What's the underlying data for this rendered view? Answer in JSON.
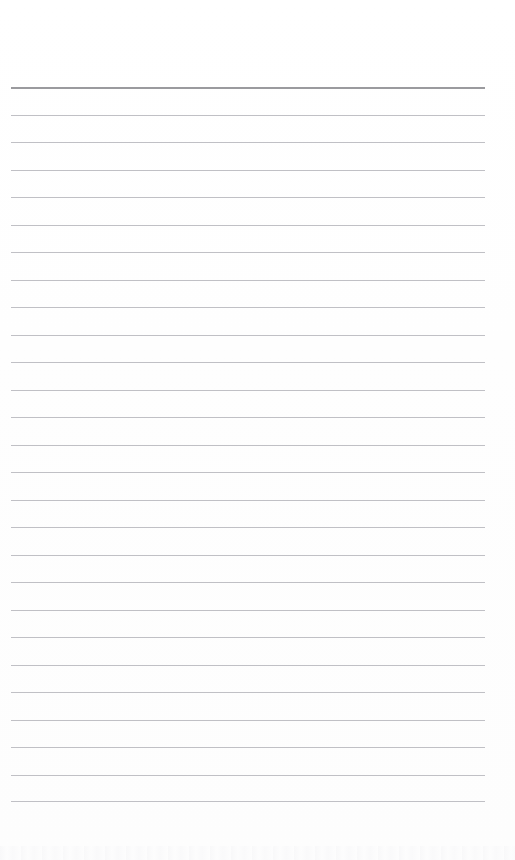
{
  "page": {
    "kind": "scanned-ruled-paper",
    "width": 515,
    "height": 860,
    "background_color": "#fefefe",
    "text_content": ""
  },
  "ruling": {
    "line_color": "#bdbdc2",
    "header_line_color": "#9a9a9e",
    "line_count": 27,
    "line_spacing": 27.5,
    "first_line_y": 87,
    "last_line_y": 801,
    "line_left_x": 11,
    "line_right_x": 485,
    "line_thickness": 1,
    "header_line_thickness": 2,
    "top_margin": 87,
    "bottom_margin": 59,
    "lines": [
      {
        "index": 1,
        "y": 87,
        "emphasis": "header"
      },
      {
        "index": 2,
        "y": 114.5,
        "emphasis": "normal"
      },
      {
        "index": 3,
        "y": 142,
        "emphasis": "normal"
      },
      {
        "index": 4,
        "y": 169.5,
        "emphasis": "normal"
      },
      {
        "index": 5,
        "y": 197,
        "emphasis": "normal"
      },
      {
        "index": 6,
        "y": 224.5,
        "emphasis": "normal"
      },
      {
        "index": 7,
        "y": 252,
        "emphasis": "normal"
      },
      {
        "index": 8,
        "y": 279.5,
        "emphasis": "normal"
      },
      {
        "index": 9,
        "y": 307,
        "emphasis": "normal"
      },
      {
        "index": 10,
        "y": 334.5,
        "emphasis": "normal"
      },
      {
        "index": 11,
        "y": 362,
        "emphasis": "normal"
      },
      {
        "index": 12,
        "y": 389.5,
        "emphasis": "normal"
      },
      {
        "index": 13,
        "y": 417,
        "emphasis": "normal"
      },
      {
        "index": 14,
        "y": 444.5,
        "emphasis": "normal"
      },
      {
        "index": 15,
        "y": 472,
        "emphasis": "normal"
      },
      {
        "index": 16,
        "y": 499.5,
        "emphasis": "normal"
      },
      {
        "index": 17,
        "y": 527,
        "emphasis": "normal"
      },
      {
        "index": 18,
        "y": 554.5,
        "emphasis": "normal"
      },
      {
        "index": 19,
        "y": 582,
        "emphasis": "normal"
      },
      {
        "index": 20,
        "y": 609.5,
        "emphasis": "normal"
      },
      {
        "index": 21,
        "y": 637,
        "emphasis": "normal"
      },
      {
        "index": 22,
        "y": 664.5,
        "emphasis": "normal"
      },
      {
        "index": 23,
        "y": 692,
        "emphasis": "normal"
      },
      {
        "index": 24,
        "y": 719.5,
        "emphasis": "normal"
      },
      {
        "index": 25,
        "y": 747,
        "emphasis": "normal"
      },
      {
        "index": 26,
        "y": 774.5,
        "emphasis": "normal"
      },
      {
        "index": 27,
        "y": 801,
        "emphasis": "normal"
      }
    ]
  },
  "artifact": {
    "present": true,
    "y": 846,
    "description": "faint scanner edge smudge"
  }
}
